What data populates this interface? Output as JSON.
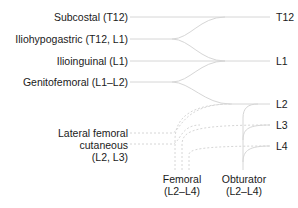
{
  "diagram": {
    "nerves": [
      {
        "id": "subcostal",
        "label": "Subcostal (T12)"
      },
      {
        "id": "iliohypogastric",
        "label": "Iliohypogastric (T12, L1)"
      },
      {
        "id": "ilioinguinal",
        "label": "Ilioinguinal (L1)"
      },
      {
        "id": "genitofemoral",
        "label": "Genitofemoral (L1–L2)"
      },
      {
        "id": "lateral_femoral_cutaneous",
        "label_lines": [
          "Lateral femoral",
          "cutaneous",
          "(L2, L3)"
        ]
      },
      {
        "id": "femoral",
        "label_lines": [
          "Femoral",
          "(L2–L4)"
        ]
      },
      {
        "id": "obturator",
        "label_lines": [
          "Obturator",
          "(L2–L4)"
        ]
      }
    ],
    "roots": [
      "T12",
      "L1",
      "L2",
      "L3",
      "L4"
    ],
    "colors": {
      "line": "#d4d4d4",
      "text": "#1a1a1a"
    }
  }
}
